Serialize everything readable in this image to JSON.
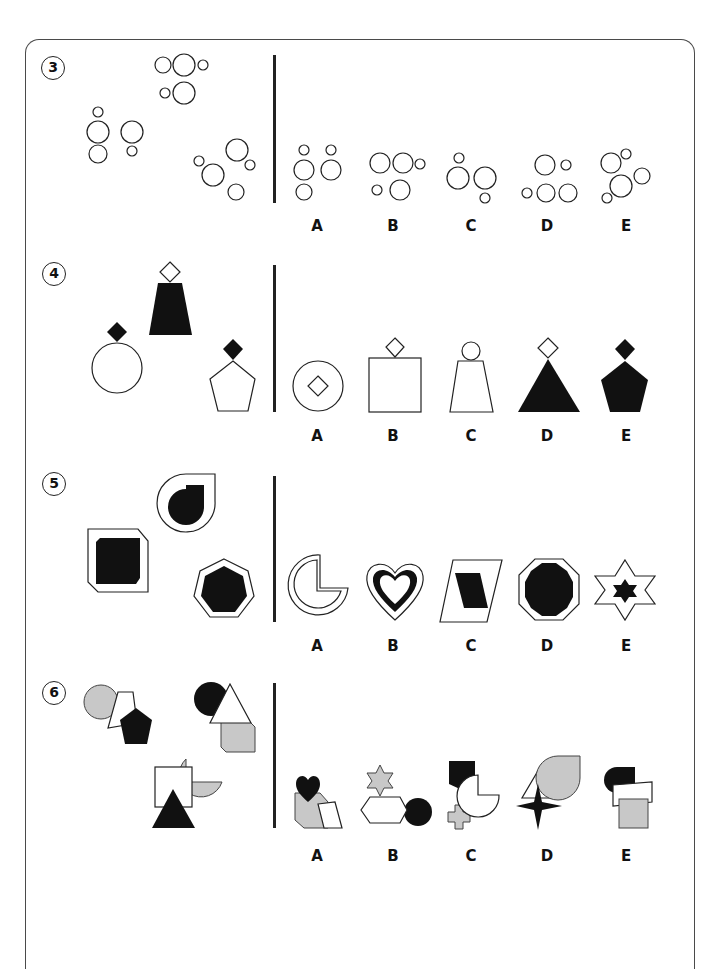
{
  "page": {
    "questions": [
      {
        "number": "3",
        "type": "odd-one-out / which belongs",
        "stem_figures": [
          "circle-cluster-1",
          "circle-cluster-2",
          "circle-cluster-3"
        ],
        "options": [
          {
            "label": "A",
            "figure": "circle-cluster-a"
          },
          {
            "label": "B",
            "figure": "circle-cluster-b"
          },
          {
            "label": "C",
            "figure": "circle-cluster-c"
          },
          {
            "label": "D",
            "figure": "circle-cluster-d"
          },
          {
            "label": "E",
            "figure": "circle-cluster-e"
          }
        ]
      },
      {
        "number": "4",
        "stem_figures": [
          "black-trapezoid-white-diamond",
          "white-circle-black-diamond",
          "white-pentagon-black-diamond"
        ],
        "options": [
          {
            "label": "A",
            "figure": "circle-with-inner-diamond"
          },
          {
            "label": "B",
            "figure": "white-square-white-diamond"
          },
          {
            "label": "C",
            "figure": "white-trapezoid-white-circle"
          },
          {
            "label": "D",
            "figure": "black-triangle-white-diamond"
          },
          {
            "label": "E",
            "figure": "black-pentagon-black-diamond"
          }
        ]
      },
      {
        "number": "5",
        "stem_figures": [
          "teardrop-in-teardrop",
          "square-in-cut-square",
          "heptagon-in-heptagon"
        ],
        "options": [
          {
            "label": "A",
            "figure": "pacman-outline"
          },
          {
            "label": "B",
            "figure": "heart-ring"
          },
          {
            "label": "C",
            "figure": "parallelogram-in-parallelogram"
          },
          {
            "label": "D",
            "figure": "decagon-in-octagon"
          },
          {
            "label": "E",
            "figure": "star-in-star"
          }
        ]
      },
      {
        "number": "6",
        "stem_figures": [
          "circle-trapezoid-pentagon",
          "circle-triangle-cutsquare",
          "square-pacman-triangle"
        ],
        "options": [
          {
            "label": "A",
            "figure": "heart-cutsquare-parallelogram"
          },
          {
            "label": "B",
            "figure": "star-hexagon-circle"
          },
          {
            "label": "C",
            "figure": "shield-cross-pacman"
          },
          {
            "label": "D",
            "figure": "triangle-teardrop-4star"
          },
          {
            "label": "E",
            "figure": "halfcircle-parallelogram-square"
          }
        ]
      }
    ]
  },
  "colors": {
    "outline": "#222222",
    "fill_black": "#111111",
    "fill_gray": "#c8c8c8",
    "fill_white": "#ffffff"
  }
}
